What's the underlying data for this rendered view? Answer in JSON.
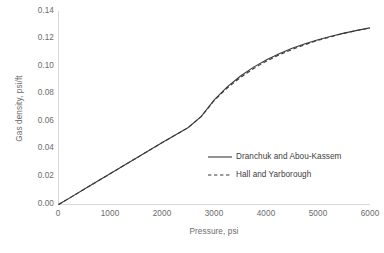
{
  "chart_data": {
    "type": "line",
    "title": "",
    "xlabel": "Pressure, psi",
    "ylabel": "Gas density, psi/ft",
    "xlim": [
      0,
      6000
    ],
    "ylim": [
      0.0,
      0.14
    ],
    "grid": false,
    "legend_position": "inside-right",
    "xticks": [
      "0",
      "1000",
      "2000",
      "3000",
      "4000",
      "5000",
      "6000"
    ],
    "yticks": [
      "0.00",
      "0.02",
      "0.04",
      "0.06",
      "0.08",
      "0.10",
      "0.12",
      "0.14"
    ],
    "x": [
      0,
      100,
      250,
      500,
      750,
      1000,
      1250,
      1500,
      1750,
      2000,
      2250,
      2500,
      2750,
      3000,
      3250,
      3500,
      3750,
      4000,
      4250,
      4500,
      4750,
      5000,
      5250,
      5500,
      5750,
      6000
    ],
    "series": [
      {
        "name": "Dranchuk and Abou-Kassem",
        "style": "solid",
        "color": "#3a3a3a",
        "values": [
          0.0,
          0.0022,
          0.0055,
          0.0112,
          0.0168,
          0.0224,
          0.028,
          0.0336,
          0.0392,
          0.0448,
          0.0503,
          0.0557,
          0.0637,
          0.0757,
          0.0851,
          0.0928,
          0.0992,
          0.1046,
          0.1091,
          0.113,
          0.1163,
          0.1192,
          0.1217,
          0.124,
          0.126,
          0.1278
        ]
      },
      {
        "name": "Hall and Yarborough",
        "style": "dashed",
        "color": "#3a3a3a",
        "values": [
          0.0,
          0.0022,
          0.0055,
          0.0112,
          0.0168,
          0.0224,
          0.028,
          0.0336,
          0.0392,
          0.0448,
          0.0503,
          0.0557,
          0.0636,
          0.0753,
          0.0843,
          0.0918,
          0.0982,
          0.1036,
          0.1082,
          0.1122,
          0.1157,
          0.1188,
          0.1214,
          0.1238,
          0.1259,
          0.1278
        ]
      }
    ]
  },
  "axes": {
    "x_title": "Pressure, psi",
    "y_title": "Gas density, psi/ft",
    "axis_color": "#d9d9d9"
  },
  "legend": {
    "entries": [
      {
        "label": "Dranchuk and Abou-Kassem",
        "style": "solid"
      },
      {
        "label": "Hall and Yarborough",
        "style": "dashed"
      }
    ]
  },
  "yticks": {
    "t0": "0.14",
    "t1": "0.12",
    "t2": "0.10",
    "t3": "0.08",
    "t4": "0.06",
    "t5": "0.04",
    "t6": "0.02",
    "t7": "0.00"
  },
  "xticks": {
    "t0": "0",
    "t1": "1000",
    "t2": "2000",
    "t3": "3000",
    "t4": "4000",
    "t5": "5000",
    "t6": "6000"
  }
}
